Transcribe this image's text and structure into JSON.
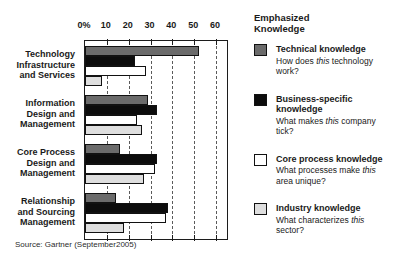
{
  "chart_data": {
    "type": "bar",
    "orientation": "horizontal",
    "title": "",
    "xlabel": "",
    "ylabel": "",
    "unit": "percent",
    "xlim": [
      0,
      65
    ],
    "x_ticks": [
      "0%",
      "10",
      "20",
      "30",
      "40",
      "50",
      "60"
    ],
    "x_tick_values": [
      0,
      10,
      20,
      30,
      40,
      50,
      60
    ],
    "grid": "dashed-vertical-gridlines",
    "legend_position": "right",
    "categories": [
      "Technology Infrastructure and Services",
      "Information Design and Management",
      "Core Process Design and Management",
      "Relationship and Sourcing Management"
    ],
    "category_label_lines": [
      [
        "Technology",
        "Infrastructure",
        "and Services"
      ],
      [
        "Information",
        "Design and",
        "Management"
      ],
      [
        "Core Process",
        "Design and",
        "Management"
      ],
      [
        "Relationship",
        "and Sourcing",
        "Management"
      ]
    ],
    "series": [
      {
        "name": "Technical knowledge",
        "color": "#6b6b6b",
        "values": [
          52,
          29,
          16,
          14
        ]
      },
      {
        "name": "Business-specific knowledge",
        "color": "#0c0c0c",
        "values": [
          23,
          33,
          33,
          38
        ]
      },
      {
        "name": "Core process knowledge",
        "color": "#ffffff",
        "values": [
          28,
          24,
          32,
          37
        ]
      },
      {
        "name": "Industry knowledge",
        "color": "#dedede",
        "values": [
          8,
          26,
          27,
          18
        ]
      }
    ]
  },
  "legend": {
    "title": "Emphasized Knowledge",
    "items": [
      {
        "title_lines": [
          "Technical knowledge"
        ],
        "color": "#6b6b6b",
        "desc_line1_pre": "How does ",
        "italic_word": "this",
        "desc_line1_post": " technology",
        "desc_line2": "work?"
      },
      {
        "title_lines": [
          "Business-specific",
          "knowledge"
        ],
        "color": "#0c0c0c",
        "desc_line1_pre": "What makes ",
        "italic_word": "this",
        "desc_line1_post": " company",
        "desc_line2": "tick?"
      },
      {
        "title_lines": [
          "Core process knowledge"
        ],
        "color": "#ffffff",
        "desc_line1_pre": "What processes make ",
        "italic_word": "this",
        "desc_line1_post": "",
        "desc_line2": "area unique?"
      },
      {
        "title_lines": [
          "Industry knowledge"
        ],
        "color": "#dedede",
        "desc_line1_pre": "What characterizes ",
        "italic_word": "this",
        "desc_line1_post": "",
        "desc_line2": "sector?"
      }
    ]
  },
  "source": "Source: Gartner (September2005)"
}
